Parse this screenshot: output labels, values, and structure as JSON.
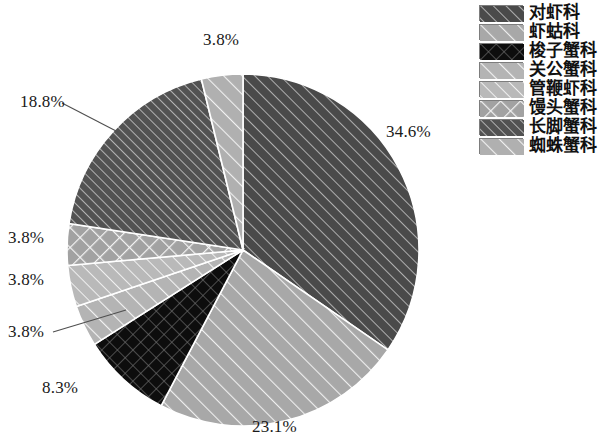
{
  "chart_data": {
    "type": "pie",
    "title": "",
    "subtitle": "",
    "xlabel": "",
    "ylabel": "",
    "legend_position": "top-right",
    "grid": false,
    "value_unit": "%",
    "start_angle_deg": 0,
    "direction": "clockwise",
    "categories": [
      "对虾科",
      "虾蛄科",
      "梭子蟹科",
      "关公蟹科",
      "管鞭虾科",
      "馒头蟹科",
      "长脚蟹科",
      "蜘蛛蟹科"
    ],
    "values": [
      34.6,
      23.1,
      8.3,
      3.8,
      3.8,
      3.8,
      18.8,
      3.8
    ],
    "labels": [
      "34.6%",
      "23.1%",
      "8.3%",
      "3.8%",
      "3.8%",
      "3.8%",
      "18.8%",
      "3.8%"
    ],
    "slices": [
      {
        "name": "对虾科",
        "value": 34.6,
        "label": "34.6%",
        "fill": "#4a4a4a",
        "pattern": "diagonal-light-lines",
        "label_x": 386,
        "label_y": 122
      },
      {
        "name": "虾蛄科",
        "value": 23.1,
        "label": "23.1%",
        "fill": "#a8a8a8",
        "pattern": "diagonal-white-lines",
        "label_x": 252,
        "label_y": 417
      },
      {
        "name": "梭子蟹科",
        "value": 8.3,
        "label": "8.3%",
        "fill": "#0d0d0d",
        "pattern": "crosshatch",
        "label_x": 42,
        "label_y": 378
      },
      {
        "name": "关公蟹科",
        "value": 3.8,
        "label": "3.8%",
        "fill": "#b4b4b4",
        "pattern": "diagonal-white-lines",
        "label_x": 8,
        "label_y": 322
      },
      {
        "name": "管鞭虾科",
        "value": 3.8,
        "label": "3.8%",
        "fill": "#b9b9b9",
        "pattern": "diagonal-fine-lines",
        "label_x": 8,
        "label_y": 270
      },
      {
        "name": "馒头蟹科",
        "value": 3.8,
        "label": "3.8%",
        "fill": "#a2a2a2",
        "pattern": "crosshatch-light",
        "label_x": 8,
        "label_y": 228
      },
      {
        "name": "长脚蟹科",
        "value": 18.8,
        "label": "18.8%",
        "fill": "#525252",
        "pattern": "diagonal-dense-lines",
        "label_x": 20,
        "label_y": 92
      },
      {
        "name": "蜘蛛蟹科",
        "value": 3.8,
        "label": "3.8%",
        "fill": "#b0b0b0",
        "pattern": "diagonal-white-lines",
        "label_x": 203,
        "label_y": 30
      }
    ]
  },
  "legend": {
    "items": [
      {
        "label": "对虾科",
        "color": "#4a4a4a",
        "pattern": "diagonal-light-lines"
      },
      {
        "label": "虾蛄科",
        "color": "#a8a8a8",
        "pattern": "diagonal-white-lines"
      },
      {
        "label": "梭子蟹科",
        "color": "#0d0d0d",
        "pattern": "crosshatch"
      },
      {
        "label": "关公蟹科",
        "color": "#b4b4b4",
        "pattern": "diagonal-white-lines"
      },
      {
        "label": "管鞭虾科",
        "color": "#b9b9b9",
        "pattern": "diagonal-fine-lines"
      },
      {
        "label": "馒头蟹科",
        "color": "#a2a2a2",
        "pattern": "crosshatch-light"
      },
      {
        "label": "长脚蟹科",
        "color": "#525252",
        "pattern": "diagonal-dense-lines"
      },
      {
        "label": "蜘蛛蟹科",
        "color": "#b0b0b0",
        "pattern": "diagonal-white-lines"
      }
    ]
  }
}
